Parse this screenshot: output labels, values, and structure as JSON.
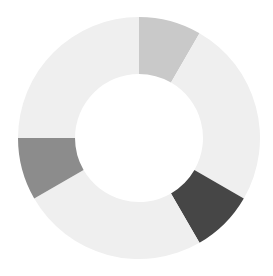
{
  "chart_data": {
    "type": "pie",
    "variant": "donut",
    "title": "",
    "legend": [],
    "labels": [
      "Segment 1",
      "Segment 2",
      "Segment 3",
      "Segment 4",
      "Segment 5",
      "Segment 6"
    ],
    "values": [
      1,
      3,
      1,
      3,
      1,
      3
    ],
    "colors": [
      "#c9c9c9",
      "#efefef",
      "#464646",
      "#efefef",
      "#8c8c8c",
      "#efefef"
    ],
    "start_angle_deg": 0,
    "direction": "clockwise",
    "center": [
      139,
      138
    ],
    "outer_radius": 121,
    "inner_radius": 64,
    "background": "#ffffff"
  }
}
